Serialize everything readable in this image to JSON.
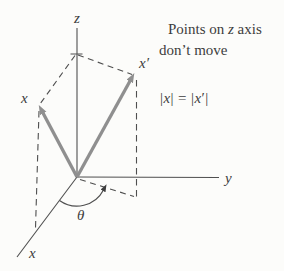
{
  "figure": {
    "background_color": "#fcfcfa",
    "line_color": "#4f4f4f",
    "vector_color": "#8f8f8f",
    "text_color": "#3d3d3d"
  },
  "axis_labels": {
    "z": "z",
    "y": "y",
    "x": "x"
  },
  "vector_labels": {
    "x": "x",
    "x_prime": "x′",
    "theta": "θ"
  },
  "annotation": {
    "line1_parts": [
      "Points on ",
      "z",
      " axis"
    ],
    "line2": "don’t move"
  },
  "equation": {
    "parts": [
      "|",
      "x",
      "| = |",
      "x",
      "′|"
    ]
  }
}
